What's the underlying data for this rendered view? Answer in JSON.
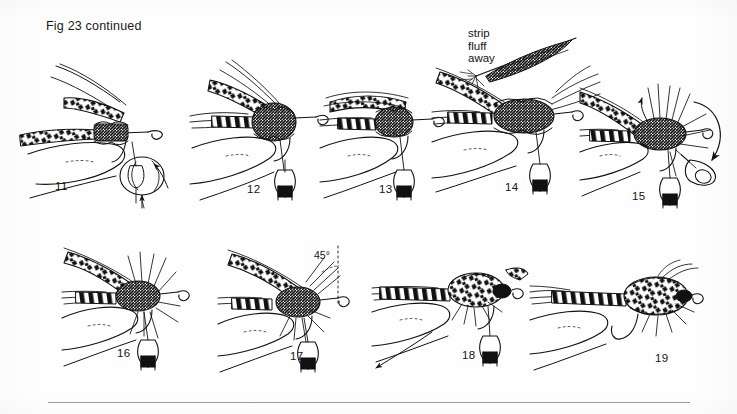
{
  "page": {
    "title": "Fig 23 continued",
    "background_color": "#fefefe",
    "ink_color": "#111111",
    "rule_color": "#9a9a9a"
  },
  "annotations": [
    {
      "id": "strip-fluff-away",
      "text": "strip\nfluff\naway",
      "lines": [
        "strip",
        "fluff",
        "away"
      ]
    },
    {
      "id": "angle-45",
      "text": "45°"
    }
  ],
  "annotation_text": {
    "strip_line1": "strip",
    "strip_line2": "fluff",
    "strip_line3": "away",
    "angle": "45°"
  },
  "steps": [
    {
      "number": "11",
      "row": 1,
      "caption_x": 55,
      "caption_y": 180,
      "description": "Hand holds hook in vise; barred wing feather tied in, thread bobbin hanging, finger pressing wing butt"
    },
    {
      "number": "12",
      "row": 1,
      "caption_x": 247,
      "caption_y": 183,
      "description": "Dubbed thorax built up over wing roots, bobbin hanging below hook"
    },
    {
      "number": "13",
      "row": 1,
      "caption_x": 379,
      "caption_y": 183,
      "description": "Wing folded back over body, thread bobbin hanging"
    },
    {
      "number": "14",
      "row": 1,
      "caption_x": 505,
      "caption_y": 181,
      "description": "Hackle feather tied in at thorax with fluff stripped from stem"
    },
    {
      "number": "15",
      "row": 1,
      "caption_x": 632,
      "caption_y": 190,
      "description": "Hackle wound with hackle pliers, curved arrow shows winding direction"
    },
    {
      "number": "16",
      "row": 2,
      "caption_x": 117,
      "caption_y": 347,
      "description": "Hackle fibres swept back, bobbin hanging beneath hook"
    },
    {
      "number": "17",
      "row": 2,
      "caption_x": 290,
      "caption_y": 350,
      "description": "Wing set at 45 degrees to the body, dotted reference line and 45° label"
    },
    {
      "number": "18",
      "row": 2,
      "caption_x": 462,
      "caption_y": 349,
      "description": "Head whip-finished, hackle trimmed, arrow indicates hook bend"
    },
    {
      "number": "19",
      "row": 2,
      "caption_x": 655,
      "caption_y": 352,
      "description": "Completed fly removed from vise, finished sedge pattern"
    }
  ],
  "bottom_rule": {
    "left": 48,
    "top": 402,
    "width": 642
  }
}
